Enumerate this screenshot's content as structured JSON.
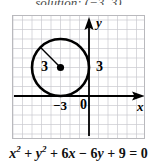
{
  "figure": {
    "type": "coordinate-plane-graph",
    "top_partial_text": "solution: (−3, 3)",
    "equation": {
      "full": "x² + y² + 6x − 6y + 9 = 0",
      "tokens": [
        {
          "kind": "var",
          "text": "x",
          "sup": "2"
        },
        {
          "kind": "op",
          "text": "+"
        },
        {
          "kind": "var",
          "text": "y",
          "sup": "2"
        },
        {
          "kind": "op",
          "text": "+"
        },
        {
          "kind": "num",
          "text": "6"
        },
        {
          "kind": "var",
          "text": "x"
        },
        {
          "kind": "op",
          "text": "−"
        },
        {
          "kind": "num",
          "text": "6"
        },
        {
          "kind": "var",
          "text": "y"
        },
        {
          "kind": "op",
          "text": "+"
        },
        {
          "kind": "num",
          "text": "9"
        },
        {
          "kind": "op",
          "text": "="
        },
        {
          "kind": "num",
          "text": "0"
        }
      ]
    },
    "axes": {
      "x_label": "x",
      "y_label": "y",
      "origin_label": "0",
      "x_tick_label": "−3",
      "x_axis_color": "#000000",
      "y_axis_color": "#000000",
      "grid_color": "#c9c9cf",
      "grid_border_color": "#b9b9bd",
      "grid_cell_px": 9.5,
      "origin_px": {
        "x": 76,
        "y": 80
      },
      "xlim": [
        -8,
        6
      ],
      "ylim": [
        -4.5,
        8.5
      ]
    },
    "annotations": {
      "radius_label_inner": "3",
      "radius_label_outer": "3",
      "center_dot_color": "#000000",
      "circle_stroke_color": "#000000"
    }
  },
  "chart_data": {
    "type": "scatter",
    "title": "",
    "subtitle": "",
    "xlabel": "x",
    "ylabel": "y",
    "xlim": [
      -8,
      6
    ],
    "ylim": [
      -4.5,
      8.5
    ],
    "grid": true,
    "legend": null,
    "tick_labels": {
      "x": [
        "−3",
        "0"
      ],
      "y": []
    },
    "annotations": [
      {
        "text": "3",
        "role": "radius-label-inside-circle",
        "x": -4.6,
        "y": 3.0
      },
      {
        "text": "3",
        "role": "radius-label-outside-circle",
        "x": 1.0,
        "y": 3.0
      },
      {
        "text": "−3",
        "role": "x-axis-tick",
        "x": -3.0,
        "y": -0.9
      },
      {
        "text": "0",
        "role": "origin-label",
        "x": -0.6,
        "y": -0.9
      },
      {
        "text": "x",
        "role": "x-axis-name",
        "x": 5.5,
        "y": -1.0
      },
      {
        "text": "y",
        "role": "y-axis-name",
        "x": 0.7,
        "y": 7.6
      }
    ],
    "shapes": [
      {
        "kind": "circle",
        "center": [
          -3,
          3
        ],
        "radius": 3,
        "stroke": "#000000",
        "stroke_width": 2.6,
        "fill": "none",
        "equation": "x² + y² + 6x − 6y + 9 = 0",
        "standard_form": "(x + 3)² + (y − 3)² = 9"
      },
      {
        "kind": "point",
        "role": "center-marker",
        "at": [
          -3,
          3
        ],
        "fill": "#000000",
        "radius_px": 3.6
      },
      {
        "kind": "segment",
        "role": "radius-segment",
        "from": [
          -3,
          3
        ],
        "to": [
          -5.12,
          5.12
        ],
        "stroke": "#000000",
        "stroke_width": 1.4
      }
    ]
  }
}
